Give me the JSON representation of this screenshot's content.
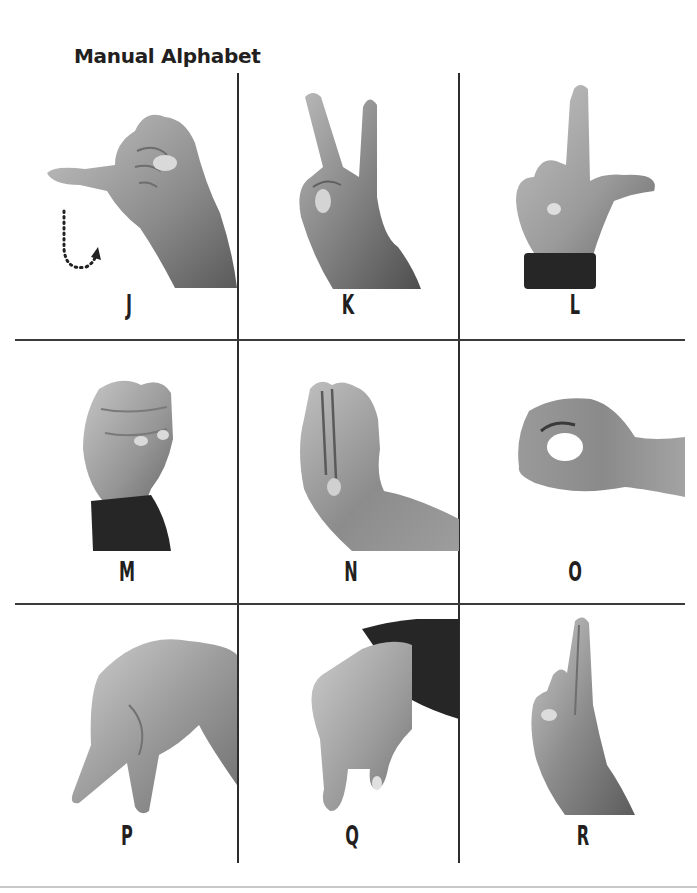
{
  "page": {
    "title": "Manual Alphabet"
  },
  "colors": {
    "text": "#231f20",
    "grid_line": "#3a3a3a",
    "footer_line": "#c8c8c8",
    "skin_light": "#b8b8b8",
    "skin_mid": "#8e8e8e",
    "skin_dark": "#5e5e5e",
    "sleeve": "#262626"
  },
  "grid": {
    "rows": [
      {
        "cells": [
          {
            "letter": "J",
            "image": "hand-sign-j",
            "motion_hint": "dotted-curved-arrow"
          },
          {
            "letter": "K",
            "image": "hand-sign-k"
          },
          {
            "letter": "L",
            "image": "hand-sign-l"
          }
        ]
      },
      {
        "cells": [
          {
            "letter": "M",
            "image": "hand-sign-m"
          },
          {
            "letter": "N",
            "image": "hand-sign-n"
          },
          {
            "letter": "O",
            "image": "hand-sign-o"
          }
        ]
      },
      {
        "cells": [
          {
            "letter": "P",
            "image": "hand-sign-p"
          },
          {
            "letter": "Q",
            "image": "hand-sign-q"
          },
          {
            "letter": "R",
            "image": "hand-sign-r"
          }
        ]
      }
    ]
  }
}
